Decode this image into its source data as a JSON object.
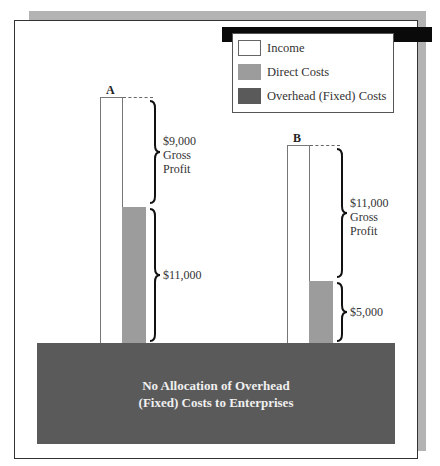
{
  "legend": {
    "items": [
      {
        "label": "Income",
        "color": "#ffffff"
      },
      {
        "label": "Direct Costs",
        "color": "#9c9c9c"
      },
      {
        "label": "Overhead (Fixed) Costs",
        "color": "#5a5a5a"
      }
    ]
  },
  "enterprises": [
    {
      "label": "A",
      "income": 20000,
      "direct_costs": 11000,
      "gross_profit": 9000,
      "gross_profit_label": "$9,000",
      "gross_profit_word1": "Gross",
      "gross_profit_word2": "Profit",
      "direct_costs_label": "$11,000"
    },
    {
      "label": "B",
      "income": 16000,
      "direct_costs": 5000,
      "gross_profit": 11000,
      "gross_profit_label": "$11,000",
      "gross_profit_word1": "Gross",
      "gross_profit_word2": "Profit",
      "direct_costs_label": "$5,000"
    }
  ],
  "overhead_block": {
    "line1": "No Allocation of Overhead",
    "line2": "(Fixed) Costs to Enterprises"
  },
  "colors": {
    "income": "#ffffff",
    "direct_costs": "#9c9c9c",
    "overhead": "#5a5a5a",
    "shadow": "#b3b3b3",
    "header_bar": "#0a0a0a"
  }
}
